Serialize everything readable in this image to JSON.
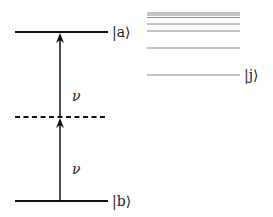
{
  "diagram": {
    "type": "energy-level diagram (two-photon transition)",
    "levels": {
      "upper": {
        "label": "|a⟩",
        "y": 32
      },
      "virtual": {
        "label": "",
        "y": 117,
        "style": "dashed"
      },
      "lower": {
        "label": "|b⟩",
        "y": 201
      }
    },
    "transitions": [
      {
        "label": "ν",
        "from": "lower",
        "to": "virtual"
      },
      {
        "label": "ν",
        "from": "virtual",
        "to": "upper"
      }
    ],
    "manifold": {
      "label": "|j⟩",
      "line_ys": [
        13,
        15,
        17,
        24,
        31,
        48,
        75
      ],
      "color": "#8a8a8a"
    },
    "colors": {
      "level": "#111111",
      "manifold": "#8a8a8a"
    }
  }
}
